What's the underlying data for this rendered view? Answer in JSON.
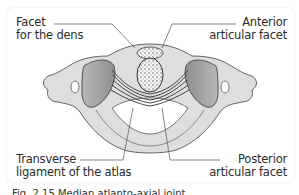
{
  "figure": {
    "labels": {
      "facet_dens": [
        "Facet",
        "for the dens"
      ],
      "anterior_facet": [
        "Anterior",
        "articular facet"
      ],
      "transverse_ligament": [
        "Transverse",
        "ligament of the atlas"
      ],
      "posterior_facet": [
        "Posterior",
        "articular facet"
      ]
    },
    "caption": "Fig. 2.15 Median atlanto-axial joint"
  },
  "colors": {
    "bone_fill": "#dcdcdc",
    "bone_outline": "#5a5a5a",
    "facet_fill": "#a9a9a9",
    "ligament_stripes": "#3a3a3a",
    "card_bg": "#ffffff",
    "leader_line": "#555555"
  }
}
